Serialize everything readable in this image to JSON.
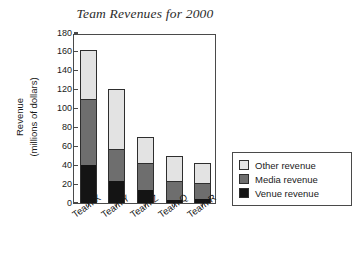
{
  "chart_data": {
    "type": "bar",
    "subtype": "stacked-bar",
    "title": "Team Revenues for 2000",
    "xlabel": "",
    "ylabel": "Revenue\n(millions of dollars)",
    "ylabel_lines": [
      "Revenue",
      "(millions of dollars)"
    ],
    "categories": [
      "Team X",
      "Team Y",
      "Team Z",
      "Team Q",
      "Team R"
    ],
    "series": [
      {
        "name": "Venue revenue",
        "values": [
          40,
          23,
          14,
          3,
          4
        ],
        "color": "#141414"
      },
      {
        "name": "Media revenue",
        "values": [
          70,
          34,
          28,
          20,
          17
        ],
        "color": "#6e6e6e"
      },
      {
        "name": "Other revenue",
        "values": [
          52,
          64,
          28,
          27,
          21
        ],
        "color": "#e3e3e3"
      }
    ],
    "stack_tops": {
      "Team X": {
        "venue": 40,
        "media": 110,
        "total": 162
      },
      "Team Y": {
        "venue": 23,
        "media": 57,
        "total": 121
      },
      "Team Z": {
        "venue": 14,
        "media": 42,
        "total": 70
      },
      "Team Q": {
        "venue": 3,
        "media": 23,
        "total": 50
      },
      "Team R": {
        "venue": 4,
        "media": 21,
        "total": 42
      }
    },
    "ylim": [
      0,
      180
    ],
    "ytick_step": 20,
    "ytick_labels": [
      "0",
      "20",
      "40",
      "60",
      "80",
      "100",
      "120",
      "140",
      "160",
      "180"
    ],
    "grid": false,
    "legend_position": "right-outside",
    "legend_entries": [
      "Other revenue",
      "Media revenue",
      "Venue revenue"
    ]
  },
  "colors": {
    "other": "#e3e3e3",
    "media": "#6e6e6e",
    "venue": "#141414",
    "axis": "#4a4a4a",
    "text": "#1a1a1a",
    "background": "#ffffff"
  }
}
